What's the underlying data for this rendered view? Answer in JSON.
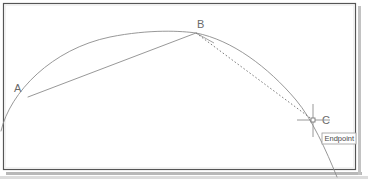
{
  "app": {
    "type": "cad-drawing-canvas",
    "background_color": "#ffffff",
    "frame_border_color": "#555555",
    "frame_shadow_color": "#b8b8b8",
    "geometry_stroke_color": "#8c8c8c",
    "dotted_stroke_color": "#6e6e6e",
    "label_color": "#6a6a6a",
    "crosshair_color": "#8c8c8c",
    "tooltip_border_color": "#9a9a9a",
    "tooltip_background": "#ffffff",
    "tooltip_text_color": "#4a4a4a"
  },
  "frame": {
    "x": 3,
    "y": 3,
    "width": 353,
    "height": 167
  },
  "drawing": {
    "title": "arc-with-chord-and-endpoint-snap",
    "points": [
      {
        "id": "A",
        "label": "A",
        "x": 28,
        "y": 97,
        "label_x": 14,
        "label_y": 92
      },
      {
        "id": "B",
        "label": "B",
        "x": 196,
        "y": 33,
        "label_x": 197,
        "label_y": 28
      },
      {
        "id": "C",
        "label": "C",
        "x": 313,
        "y": 120,
        "label_x": 322,
        "label_y": 124
      }
    ],
    "arc_path": "M 1 131 C 10 92 52 49 110 37 C 150 29 182 31 196 33 C 232 40 268 67 296 100 C 312 119 326 150 337 177",
    "chord_ab_path": "M 28 97 L 196 33",
    "chord_bc_path": "M 196 33 L 313 120",
    "chord_bc_dash": "1.6 2.1",
    "tangent_stub_path": "M 196 33 L 214 43"
  },
  "cursor": {
    "name": "osnap-crosshair",
    "x": 313,
    "y": 120,
    "h_arm_left": 297,
    "h_arm_right": 330,
    "v_arm_top": 104,
    "v_arm_bottom": 137,
    "marker_size": 4
  },
  "tooltip": {
    "label": "Endpoint",
    "x": 322,
    "y": 133,
    "width": 34,
    "height": 11
  }
}
